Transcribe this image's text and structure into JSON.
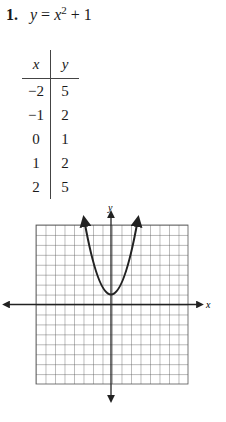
{
  "problem": {
    "number": "1.",
    "lhs": "y",
    "eq": " = ",
    "var": "x",
    "exp": "2",
    "rest": " + 1"
  },
  "table": {
    "headers": [
      "x",
      "y"
    ],
    "rows": [
      [
        "−2",
        "5"
      ],
      [
        "−1",
        "2"
      ],
      [
        "0",
        "1"
      ],
      [
        "1",
        "2"
      ],
      [
        "2",
        "5"
      ]
    ]
  },
  "graph": {
    "x_label": "x",
    "y_label": "y",
    "function": "y = x^2 + 1",
    "grid_cells": 16
  }
}
